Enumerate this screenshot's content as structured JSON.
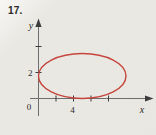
{
  "figure": {
    "number": "17.",
    "background": "#e9e7e2"
  },
  "chart_data": {
    "type": "line",
    "curve": "ellipse",
    "title": "",
    "xlabel": "x",
    "ylabel": "y",
    "origin_label": "0",
    "x_ticks": [
      2,
      4,
      6,
      8
    ],
    "x_tick_labels": [
      "",
      "4",
      "",
      ""
    ],
    "y_ticks": [
      2,
      4
    ],
    "y_tick_labels": [
      "2",
      ""
    ],
    "xlim": [
      -1,
      13
    ],
    "ylim": [
      -1.4,
      6
    ],
    "grid": false,
    "legend": false,
    "ellipse": {
      "center_x": 5,
      "center_y": 2,
      "rx": 5,
      "ry": 2,
      "tangent_to_x_axis": true,
      "tangent_to_y_axis": true
    },
    "curve_color": "#c5463e",
    "axis_color": "#6e6e6e",
    "tick_color": "#3c3c3c",
    "text_color": "#2b2b2b"
  }
}
